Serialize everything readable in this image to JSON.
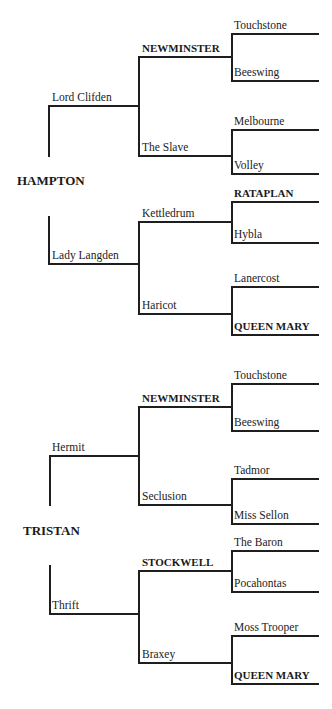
{
  "pedigrees": [
    {
      "horse": "HAMPTON",
      "sire": {
        "name": "Lord Clifden",
        "sire": {
          "name": "NEWMINSTER",
          "sire": "Touchstone",
          "dam": "Beeswing"
        },
        "dam": {
          "name": "The Slave",
          "sire": "Melbourne",
          "dam": "Volley"
        }
      },
      "dam": {
        "name": "Lady Langden",
        "sire": {
          "name": "Kettledrum",
          "sire": "RATAPLAN",
          "dam": "Hybla"
        },
        "dam": {
          "name": "Haricot",
          "sire": "Lanercost",
          "dam": "QUEEN MARY"
        }
      }
    },
    {
      "horse": "TRISTAN",
      "sire": {
        "name": "Hermit",
        "sire": {
          "name": "NEWMINSTER",
          "sire": "Touchstone",
          "dam": "Beeswing"
        },
        "dam": {
          "name": "Seclusion",
          "sire": "Tadmor",
          "dam": "Miss Sellon"
        }
      },
      "dam": {
        "name": "Thrift",
        "sire": {
          "name": "STOCKWELL",
          "sire": "The Baron",
          "dam": "Pocahontas"
        },
        "dam": {
          "name": "Braxey",
          "sire": "Moss Trooper",
          "dam": "QUEEN MARY"
        }
      }
    }
  ],
  "highlighted_ancestors": [
    "NEWMINSTER",
    "RATAPLAN",
    "QUEEN MARY",
    "STOCKWELL"
  ],
  "colors": {
    "line": "#1e1e1e",
    "text": "#222222",
    "background": "#ffffff"
  }
}
